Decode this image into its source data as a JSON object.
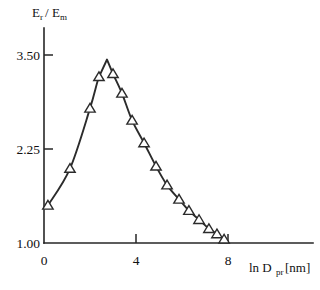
{
  "chart_data": {
    "type": "line",
    "title": "",
    "subtitle": "",
    "xlabel": "ln D_pr [nm]",
    "xlabel_parts": {
      "lead": "ln D",
      "sub": "pr",
      "tail": "[nm]"
    },
    "ylabel": "E_r/E_m",
    "ylabel_parts": {
      "num": "E",
      "num_sub": "r",
      "slash": "/",
      "den": "E",
      "den_sub": "m"
    },
    "xlim": [
      0,
      8.6
    ],
    "ylim": [
      1.0,
      3.75
    ],
    "xticks": [
      0,
      4,
      8
    ],
    "xticklabels": [
      "0",
      "4",
      "8"
    ],
    "yticks": [
      1.0,
      2.25,
      3.5
    ],
    "yticklabels": [
      "1.00",
      "2.25",
      "3.50"
    ],
    "grid": false,
    "legend": false,
    "marker": "triangle-up-open",
    "line_color": "#2b2b2b",
    "marker_face_color": "#ffffff",
    "series": [
      {
        "name": "Er/Em",
        "x": [
          0.17,
          1.13,
          2.0,
          2.39,
          2.74,
          3.0,
          3.39,
          3.83,
          4.35,
          4.87,
          5.35,
          5.87,
          6.3,
          6.74,
          7.17,
          7.52,
          7.83,
          8.0
        ],
        "y": [
          1.5,
          1.99,
          2.79,
          3.21,
          3.44,
          3.25,
          2.99,
          2.63,
          2.33,
          2.02,
          1.77,
          1.58,
          1.43,
          1.31,
          1.19,
          1.12,
          1.05,
          1.02
        ],
        "markers_shown": [
          0,
          1,
          2,
          3,
          5,
          6,
          7,
          8,
          9,
          10,
          11,
          12,
          13,
          14,
          15,
          16
        ]
      }
    ]
  },
  "axes": {
    "y_axis_name": "vertical-axis",
    "x_axis_name": "horizontal-axis"
  }
}
